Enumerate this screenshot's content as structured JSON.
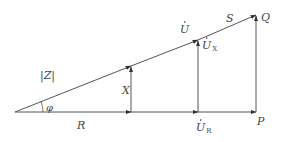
{
  "diagram": {
    "colors": {
      "line": "#555555",
      "text": "#444444",
      "background": "#ffffff"
    },
    "points": {
      "origin": [
        15,
        112
      ],
      "x_top": [
        131,
        66
      ],
      "ux_top": [
        198,
        40
      ],
      "q_top": [
        256,
        15
      ],
      "x_base": [
        131,
        112
      ],
      "ur_base": [
        198,
        112
      ],
      "p_base": [
        256,
        112
      ]
    },
    "labels": {
      "z": "|Z|",
      "phi": "φ",
      "x": "X",
      "r": "R",
      "u": "U",
      "ux_main": "U",
      "ux_sub": "X",
      "s": "S",
      "q": "Q",
      "ur_main": "U",
      "ur_sub": "R",
      "p": "P"
    }
  }
}
